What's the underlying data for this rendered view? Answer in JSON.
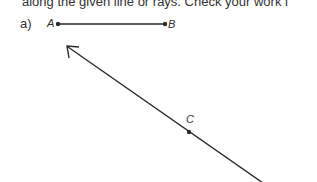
{
  "instruction_fragment": "along the given line or rays. Check your work i",
  "part": {
    "label": "a)",
    "segment": {
      "start_label": "A",
      "end_label": "B"
    },
    "ray": {
      "point_label": "C",
      "direction": "up-left arrow"
    }
  },
  "colors": {
    "ink": "#2b2b2b",
    "background": "#ffffff"
  }
}
